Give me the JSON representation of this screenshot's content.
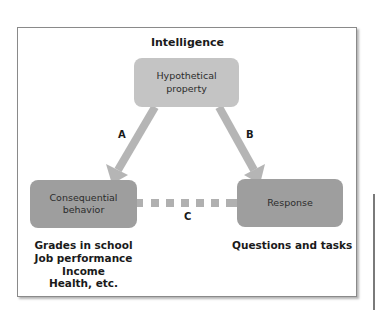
{
  "diagram": {
    "title": "Intelligence",
    "nodes": {
      "top": {
        "line1": "Hypothetical",
        "line2": "property"
      },
      "left": {
        "line1": "Consequential",
        "line2": "behavior"
      },
      "right": {
        "line1": "Response"
      }
    },
    "edges": [
      {
        "label": "A",
        "from": "Hypothetical property",
        "to": "Consequential behavior",
        "style": "solid-arrow"
      },
      {
        "label": "B",
        "from": "Hypothetical property",
        "to": "Response",
        "style": "solid-arrow"
      },
      {
        "label": "C",
        "from": "Consequential behavior",
        "to": "Response",
        "style": "dashed"
      }
    ],
    "captions": {
      "left": [
        "Grades in school",
        "Job performance",
        "Income",
        "Health, etc."
      ],
      "right": [
        "Questions and tasks"
      ]
    },
    "colors": {
      "top_node": "#c4c4c4",
      "bottom_nodes": "#9e9e9e",
      "arrows": "#b5b5b5",
      "frame_border": "#8a8a8a"
    }
  }
}
